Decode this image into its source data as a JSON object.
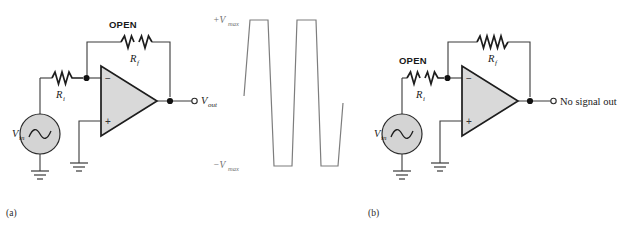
{
  "figure": {
    "type": "circuit-diagram",
    "panels": [
      {
        "id": "a",
        "caption": "(a)",
        "source_label": "V",
        "source_sub": "in",
        "input_resistor": {
          "label": "R",
          "sub": "i",
          "state": "closed"
        },
        "feedback_resistor": {
          "label": "R",
          "sub": "f",
          "state": "open",
          "state_label": "OPEN"
        },
        "opamp": {
          "inverting_sign": "−",
          "noninverting_sign": "+"
        },
        "output_label": "V",
        "output_sub": "out"
      },
      {
        "id": "b",
        "caption": "(b)",
        "source_label": "V",
        "source_sub": "in",
        "input_resistor": {
          "label": "R",
          "sub": "i",
          "state": "open",
          "state_label": "OPEN"
        },
        "feedback_resistor": {
          "label": "R",
          "sub": "f",
          "state": "closed"
        },
        "opamp": {
          "inverting_sign": "−",
          "noninverting_sign": "+"
        },
        "output_label": "No signal out"
      }
    ],
    "waveform": {
      "top_label": "+V",
      "top_label_sub": "max",
      "bottom_label": "−V",
      "bottom_label_sub": "max",
      "shape": "clipped-square-saturation",
      "color": "#7d7d7d"
    },
    "colors": {
      "wire": "#3a3a3a",
      "opamp_fill": "#d9d9d9",
      "source_fill": "#d4d4d4",
      "waveform": "#7d7d7d",
      "text": "#1a1a1a"
    }
  }
}
